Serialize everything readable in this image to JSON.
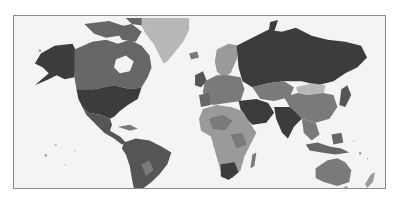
{
  "map": {
    "type": "choropleth",
    "projection": "mercator",
    "palette": {
      "ocean": "#f4f4f4",
      "very_dark": "#3c3c3c",
      "dark": "#555555",
      "medium_dark": "#666666",
      "medium": "#7a7a7a",
      "light": "#9a9a9a",
      "very_light": "#b8b8b8",
      "border": "#8a8a8a"
    },
    "regions": [
      {
        "name": "alaska",
        "shade": "very_dark"
      },
      {
        "name": "canada",
        "shade": "medium_dark"
      },
      {
        "name": "greenland",
        "shade": "very_light"
      },
      {
        "name": "usa",
        "shade": "very_dark"
      },
      {
        "name": "mexico-central-america",
        "shade": "dark"
      },
      {
        "name": "south-america",
        "shade": "dark"
      },
      {
        "name": "europe",
        "shade": "medium"
      },
      {
        "name": "scandinavia",
        "shade": "light"
      },
      {
        "name": "russia",
        "shade": "very_dark"
      },
      {
        "name": "central-asia",
        "shade": "medium"
      },
      {
        "name": "mongolia",
        "shade": "very_light"
      },
      {
        "name": "china",
        "shade": "medium"
      },
      {
        "name": "middle-east",
        "shade": "very_dark"
      },
      {
        "name": "india",
        "shade": "very_dark"
      },
      {
        "name": "southeast-asia",
        "shade": "medium"
      },
      {
        "name": "africa",
        "shade": "light"
      },
      {
        "name": "south-africa",
        "shade": "very_dark"
      },
      {
        "name": "madagascar",
        "shade": "medium"
      },
      {
        "name": "australia",
        "shade": "medium"
      },
      {
        "name": "new-zealand",
        "shade": "light"
      },
      {
        "name": "japan",
        "shade": "dark"
      },
      {
        "name": "indonesia",
        "shade": "medium_dark"
      }
    ]
  }
}
